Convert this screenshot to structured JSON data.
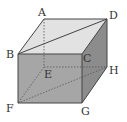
{
  "diagram": {
    "type": "cube",
    "colors": {
      "background": "#ffffff",
      "top_face": "#e2e2e2",
      "front_face": "#a6a6a6",
      "right_face": "#8c8c8c",
      "edge": "#444444",
      "hidden_edge": "#555555"
    },
    "vertices": {
      "A": {
        "label": "A",
        "x": 44,
        "y": 19
      },
      "B": {
        "label": "B",
        "x": 18,
        "y": 54
      },
      "C": {
        "label": "C",
        "x": 82,
        "y": 54
      },
      "D": {
        "label": "D",
        "x": 107,
        "y": 19
      },
      "E": {
        "label": "E",
        "x": 44,
        "y": 67
      },
      "F": {
        "label": "F",
        "x": 18,
        "y": 103
      },
      "G": {
        "label": "G",
        "x": 82,
        "y": 103
      },
      "H": {
        "label": "H",
        "x": 107,
        "y": 67
      }
    },
    "solid_edges": [
      "AB",
      "AD",
      "BC",
      "CD",
      "BF",
      "CG",
      "DH",
      "FG",
      "GH",
      "BD"
    ],
    "dashed_edges": [
      "AE",
      "EF",
      "EH",
      "FH"
    ],
    "labels": {
      "A": "A",
      "B": "B",
      "C": "C",
      "D": "D",
      "E": "E",
      "F": "F",
      "G": "G",
      "H": "H"
    }
  }
}
